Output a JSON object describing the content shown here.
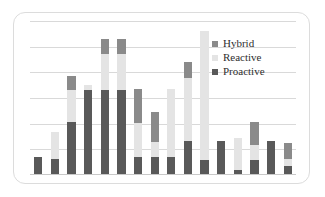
{
  "legend": {
    "position": "top-right",
    "entries": [
      {
        "label": "Hybrid",
        "color": "#8a8a8a",
        "key": "hybrid"
      },
      {
        "label": "Reactive",
        "color": "#e4e4e4",
        "key": "reactive"
      },
      {
        "label": "Proactive",
        "color": "#595959",
        "key": "proactive"
      }
    ]
  },
  "chart_data": {
    "type": "bar",
    "subtype": "stacked-column",
    "title": "",
    "xlabel": "",
    "ylabel": "",
    "ylim": [
      0,
      120
    ],
    "grid": true,
    "gridlines": [
      20,
      40,
      60,
      80,
      100,
      120
    ],
    "xtick_labels": [],
    "categories": [
      "1",
      "2",
      "3",
      "4",
      "5",
      "6",
      "7",
      "8",
      "9",
      "10",
      "11",
      "12",
      "13",
      "14",
      "15",
      "16"
    ],
    "series": [
      {
        "name": "Proactive",
        "color": "#595959",
        "values": [
          13,
          12,
          41,
          66,
          66,
          66,
          13,
          13,
          13,
          26,
          11,
          26,
          3,
          11,
          26,
          6
        ]
      },
      {
        "name": "Reactive",
        "color": "#e4e4e4",
        "values": [
          0,
          21,
          25,
          4,
          28,
          28,
          27,
          12,
          54,
          49,
          101,
          0,
          25,
          12,
          0,
          6
        ]
      },
      {
        "name": "Hybrid",
        "color": "#8a8a8a",
        "values": [
          0,
          0,
          11,
          0,
          12,
          12,
          27,
          24,
          0,
          13,
          0,
          0,
          0,
          18,
          0,
          12
        ]
      }
    ]
  }
}
